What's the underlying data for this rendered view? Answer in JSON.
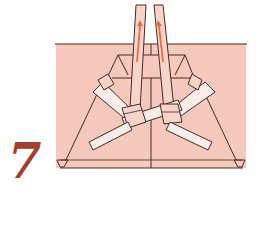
{
  "step": {
    "number": "7"
  },
  "illustration": {
    "subject": "folded-cloth-with-knotted-straps",
    "arrows": [
      {
        "direction": "up",
        "strap": "left"
      },
      {
        "direction": "up",
        "strap": "right"
      }
    ],
    "colors": {
      "paper": "#f5c9bc",
      "outline": "#4a2a22",
      "strap": "#f7d4c8",
      "strap_light": "#fbeee8",
      "arrow": "#e86c48",
      "step_number": "#a3402b"
    }
  }
}
